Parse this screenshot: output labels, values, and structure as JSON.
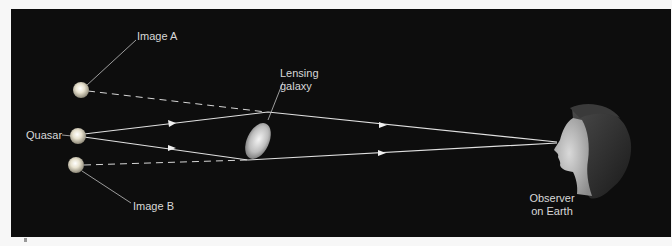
{
  "diagram": {
    "background_color": "#0d0d0d",
    "text_color": "#d8d8d8",
    "nodes": [
      {
        "id": "image_a",
        "label": "Image A"
      },
      {
        "id": "quasar",
        "label": "Quasar"
      },
      {
        "id": "image_b",
        "label": "Image B"
      },
      {
        "id": "lensing_galaxy",
        "label_lines": [
          "Lensing",
          "galaxy"
        ]
      },
      {
        "id": "observer",
        "label_lines": [
          "Observer",
          "on Earth"
        ]
      }
    ],
    "edges": [
      {
        "from": "quasar",
        "via": "lensing_galaxy_top",
        "to": "observer",
        "style": "solid-arrow"
      },
      {
        "from": "quasar",
        "via": "lensing_galaxy_bottom",
        "to": "observer",
        "style": "solid-arrow"
      },
      {
        "from": "image_a",
        "to": "lensing_galaxy_top",
        "style": "dashed"
      },
      {
        "from": "image_b",
        "to": "lensing_galaxy_bottom",
        "style": "dashed"
      }
    ]
  },
  "labels": {
    "image_a": "Image A",
    "quasar": "Quasar",
    "image_b": "Image B",
    "galaxy_line1": "Lensing",
    "galaxy_line2": "galaxy",
    "observer_line1": "Observer",
    "observer_line2": "on Earth"
  }
}
